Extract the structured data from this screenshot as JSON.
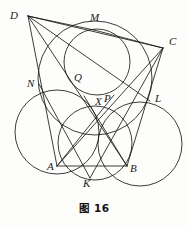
{
  "figure": {
    "caption": "图 16",
    "stroke_color": "#1a1a1a",
    "background_color": "#fdfdfb",
    "width": 189,
    "height": 226
  },
  "points": {
    "A": {
      "label": "A",
      "x": 57,
      "y": 166,
      "label_x": 47,
      "label_y": 161
    },
    "B": {
      "label": "B",
      "x": 127,
      "y": 166,
      "label_x": 130,
      "label_y": 163
    },
    "C": {
      "label": "C",
      "x": 163,
      "y": 48,
      "label_x": 169,
      "label_y": 36
    },
    "D": {
      "label": "D",
      "x": 28,
      "y": 16,
      "label_x": 10,
      "label_y": 10
    },
    "K": {
      "label": "K",
      "x": 90,
      "y": 178,
      "label_x": 84,
      "label_y": 178
    },
    "L": {
      "label": "L",
      "x": 150,
      "y": 101,
      "label_x": 155,
      "label_y": 93
    },
    "M": {
      "label": "M",
      "x": 94,
      "y": 30,
      "label_x": 90,
      "label_y": 12
    },
    "N": {
      "label": "N",
      "x": 39,
      "y": 84,
      "label_x": 27,
      "label_y": 78
    },
    "P": {
      "label": "P",
      "x": 106,
      "y": 105,
      "label_x": 105,
      "label_y": 93
    },
    "Q": {
      "label": "Q",
      "x": 71,
      "y": 80,
      "label_x": 74,
      "label_y": 72
    },
    "X": {
      "label": "X",
      "x": 101,
      "y": 110,
      "label_x": 95,
      "label_y": 96
    }
  },
  "circles": [
    {
      "name": "incircle",
      "cx": 97,
      "cy": 62,
      "r": 33
    },
    {
      "name": "excircle-left",
      "cx": 57,
      "cy": 132,
      "r": 42
    },
    {
      "name": "excircle-right",
      "cx": 140,
      "cy": 144,
      "r": 42
    },
    {
      "name": "circle-through-N-Q-L",
      "cx": 95,
      "cy": 78,
      "r": 57
    },
    {
      "name": "circle-through-K-X",
      "cx": 95,
      "cy": 143,
      "r": 37
    }
  ],
  "segments": [
    {
      "name": "AB",
      "from": "A",
      "to": "B"
    },
    {
      "name": "AD",
      "from": "A",
      "to": "D"
    },
    {
      "name": "DM",
      "from": "D",
      "to": "M"
    },
    {
      "name": "DC",
      "from": "D",
      "to": "C"
    },
    {
      "name": "DL",
      "from": "D",
      "to": "L"
    },
    {
      "name": "DB",
      "from": "D",
      "to": "B"
    },
    {
      "name": "MC",
      "from": "M",
      "to": "C"
    },
    {
      "name": "CA",
      "from": "C",
      "to": "A"
    },
    {
      "name": "CK",
      "from": "C",
      "to": "K"
    },
    {
      "name": "CB",
      "from": "C",
      "to": "B"
    },
    {
      "name": "NK",
      "from": "N",
      "to": "K"
    },
    {
      "name": "AX",
      "from": "A",
      "to": "X"
    },
    {
      "name": "XB",
      "from": "X",
      "to": "B"
    }
  ],
  "labels_order": [
    "D",
    "M",
    "C",
    "N",
    "Q",
    "X",
    "P",
    "L",
    "A",
    "K",
    "B"
  ]
}
